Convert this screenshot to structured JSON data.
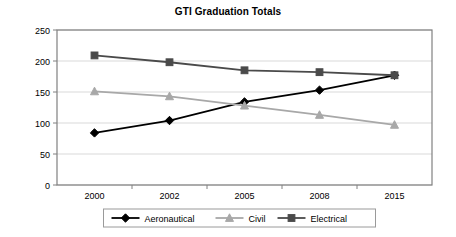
{
  "chart_data": {
    "type": "line",
    "title": "GTI Graduation Totals",
    "xlabel": "",
    "ylabel": "",
    "categories": [
      "2000",
      "2002",
      "2005",
      "2008",
      "2015"
    ],
    "ylim": [
      0,
      250
    ],
    "yticks": [
      "0",
      "50",
      "100",
      "150",
      "200",
      "250"
    ],
    "grid": true,
    "legend_position": "bottom",
    "series": [
      {
        "name": "Aeronautical",
        "marker": "diamond",
        "color": "#000000",
        "values": [
          84,
          104,
          134,
          153,
          177
        ]
      },
      {
        "name": "Civil",
        "marker": "triangle",
        "color": "#a8a8a8",
        "values": [
          151,
          143,
          128,
          113,
          97
        ]
      },
      {
        "name": "Electrical",
        "marker": "square",
        "color": "#4a4a4a",
        "values": [
          209,
          198,
          185,
          182,
          177
        ]
      }
    ]
  },
  "axes": {
    "gridline_color": "#d9d9d9",
    "axis_color": "#808080"
  },
  "legend": {
    "border_color": "#9a9a9a",
    "entries": [
      "Aeronautical",
      "Civil",
      "Electrical"
    ]
  }
}
